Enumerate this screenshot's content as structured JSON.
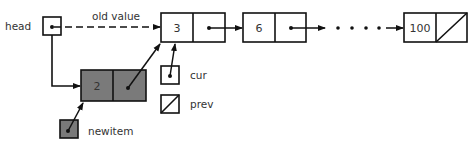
{
  "diagram": {
    "type": "linked-list-insertion",
    "labels": {
      "head": "head",
      "old_value": "old value",
      "cur": "cur",
      "prev": "prev",
      "newitem": "newitem",
      "ellipsis": "• • • •"
    },
    "nodes": [
      {
        "id": "node-3",
        "value": "3",
        "next": "node-6",
        "shaded": false
      },
      {
        "id": "node-6",
        "value": "6",
        "next": "...",
        "shaded": false
      },
      {
        "id": "node-100",
        "value": "100",
        "next": "null",
        "shaded": false
      },
      {
        "id": "node-2",
        "value": "2",
        "next": "node-3",
        "shaded": true
      }
    ],
    "pointers": [
      {
        "name": "head",
        "points_to": "node-2",
        "old_target": "node-3"
      },
      {
        "name": "cur",
        "points_to": "node-3"
      },
      {
        "name": "prev",
        "points_to": "null"
      },
      {
        "name": "newitem",
        "points_to": "node-2",
        "shaded": true
      }
    ],
    "colors": {
      "stroke": "#111111",
      "shaded_fill": "#7a7a7a",
      "background": "#ffffff",
      "text": "#333333"
    }
  }
}
